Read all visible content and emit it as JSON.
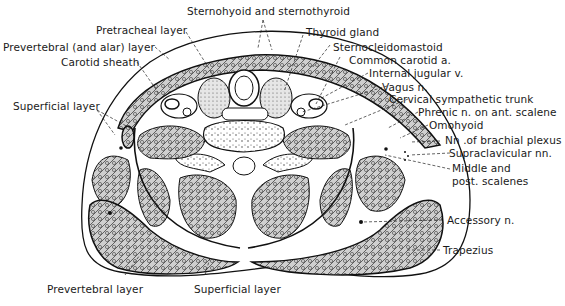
{
  "figure": {
    "labels": {
      "sternohyoid": "Sternohyoid and sternothyroid",
      "pretracheal": "Pretracheal layer",
      "prevertebral_alar": "Prevertebral (and alar) layer",
      "carotid_sheath": "Carotid sheath",
      "thyroid_gland": "Thyroid gland",
      "sternocleidomastoid": "Sternocleidomastoid",
      "common_carotid": "Common carotid a.",
      "internal_jugular": "Internal jugular v.",
      "vagus": "Vagus n.",
      "cervical_sympathetic": "Cervical sympathetic trunk",
      "phrenic": "Phrenic n. on ant. scalene",
      "omohyoid": "Omohyoid",
      "brachial_plexus": "Nn .of brachial plexus",
      "supraclavicular": "Supraclavicular nn.",
      "middle_scalenes_1": "Middle and",
      "middle_scalenes_2": "post. scalenes",
      "superficial_left": "Superficial layer",
      "accessory": "Accessory n.",
      "trapezius": "Trapezius",
      "prevertebral_bottom": "Prevertebral layer",
      "superficial_bottom": "Superficial layer"
    }
  }
}
